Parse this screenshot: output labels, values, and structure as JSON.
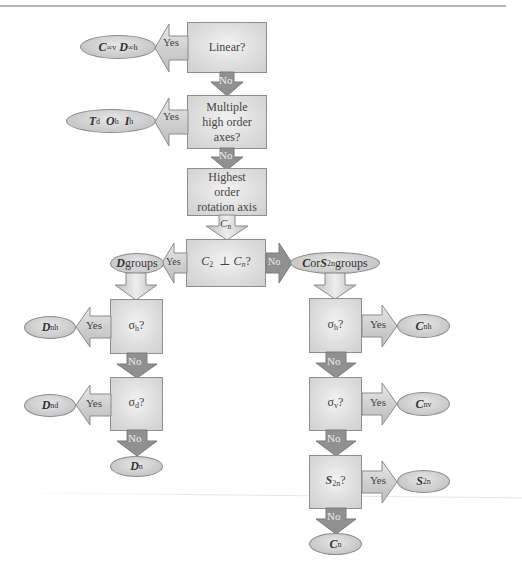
{
  "diagram": {
    "colors": {
      "box_fill": "#dcdcdc",
      "box_border": "#8e8e8e",
      "oval_fill": "#c8c8c8",
      "arrow_dark": "#8a8a8a",
      "arrow_light": "#d9d9d9"
    },
    "nodes": {
      "linear": {
        "label": "Linear?"
      },
      "multiple": {
        "line1": "Multiple",
        "line2": "high order",
        "line3": "axes?"
      },
      "highest": {
        "line1": "Highest",
        "line2": "order",
        "line3": "rotation axis"
      },
      "c2perp": {
        "a": "C",
        "a_sub": "2",
        "perp": "⊥",
        "b": "C",
        "b_sub": "n",
        "q": "?"
      },
      "left_sigma_h": {
        "sym": "σ",
        "sub": "h",
        "q": "?"
      },
      "left_sigma_d": {
        "sym": "σ",
        "sub": "d",
        "q": "?"
      },
      "right_sigma_h": {
        "sym": "σ",
        "sub": "h",
        "q": "?"
      },
      "right_sigma_v": {
        "sym": "σ",
        "sub": "v",
        "q": "?"
      },
      "right_s2n": {
        "sym": "S",
        "sub": "2n",
        "q": "?"
      }
    },
    "results": {
      "linear_yes": {
        "a": "C",
        "a_sub": "∞v",
        "b": "D",
        "b_sub": "∞h"
      },
      "multiple_yes": {
        "a": "T",
        "a_sub": "d",
        "b": "O",
        "b_sub": "h",
        "c": "I",
        "c_sub": "h"
      },
      "d_groups": {
        "sym": "D",
        "text": " groups"
      },
      "c_groups": {
        "sym1": "C",
        "mid": " or ",
        "sym2": "S",
        "sym2_sub": "2n",
        "text": " groups"
      },
      "dnh": {
        "sym": "D",
        "sub": "nh"
      },
      "dnd": {
        "sym": "D",
        "sub": "nd"
      },
      "dn": {
        "sym": "D",
        "sub": "n"
      },
      "cnh": {
        "sym": "C",
        "sub": "nh"
      },
      "cnv": {
        "sym": "C",
        "sub": "nv"
      },
      "s2n": {
        "sym": "S",
        "sub": "2n"
      },
      "cn": {
        "sym": "C",
        "sub": "n"
      }
    },
    "edges": {
      "yes": "Yes",
      "no": "No",
      "cn_sym": "C",
      "cn_sub": "n"
    }
  }
}
